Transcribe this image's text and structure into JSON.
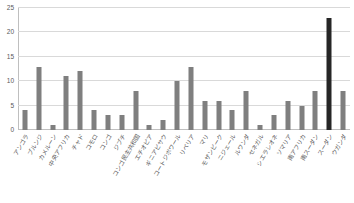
{
  "chart_data": {
    "type": "bar",
    "title": "",
    "subtitle": "",
    "xlabel": "",
    "ylabel": "",
    "ylim": [
      0,
      25
    ],
    "yticks": [
      0,
      5,
      10,
      15,
      20,
      25
    ],
    "ytick_labels": [
      "0",
      "5",
      "10",
      "15",
      "20",
      "25"
    ],
    "grid": true,
    "legend": false,
    "legend_position": "none",
    "bar_color": "#7f7f7f",
    "highlight_color": "#262626",
    "highlight_category": "スーダン",
    "categories": [
      "アンゴラ",
      "ブルンジ",
      "カメルーン",
      "中央アフリカ",
      "チャド",
      "コモロ",
      "コンゴ",
      "ジブチ",
      "コンゴ民主共和国",
      "エチオピア",
      "ギニアビサウ",
      "コートジボワール",
      "リベリア",
      "マリ",
      "モザンビーク",
      "ニジェール",
      "ルワンダ",
      "セネガル",
      "シエラレオネ",
      "ソマリア",
      "南アフリカ",
      "南スーダン",
      "スーダン",
      "ウガンダ"
    ],
    "values": [
      4,
      13,
      1,
      11,
      12,
      4,
      3,
      3,
      8,
      1,
      2,
      10,
      13,
      6,
      6,
      4,
      8,
      1,
      3,
      6,
      5,
      8,
      23,
      8
    ]
  }
}
